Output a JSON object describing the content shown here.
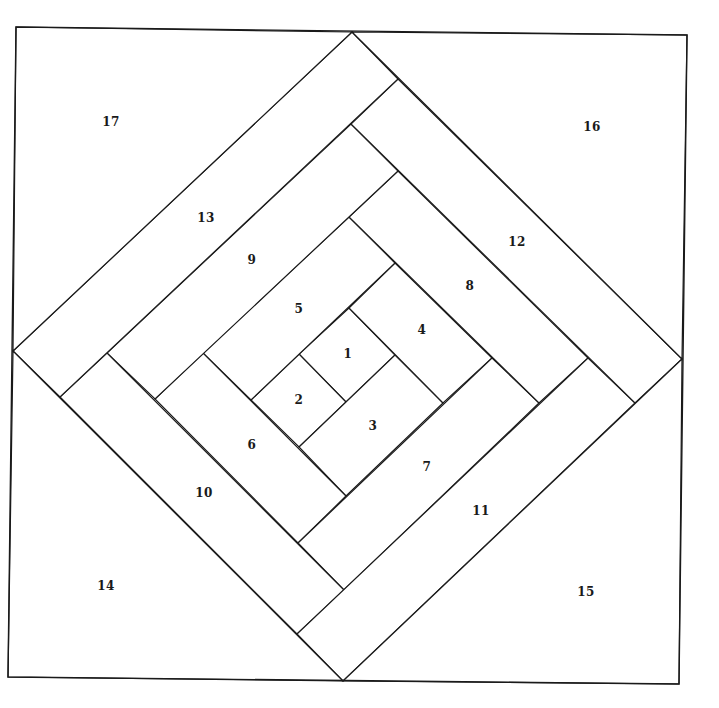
{
  "diagram": {
    "outer_square": [
      [
        16,
        27
      ],
      [
        687,
        35
      ],
      [
        679,
        684
      ],
      [
        8,
        677
      ]
    ],
    "stroke_color": "#1a1a1a",
    "background": "#ffffff",
    "pieces": [
      {
        "id": "1",
        "label": "1",
        "label_pos": [
          348,
          354
        ],
        "points": [
          [
            299,
            354
          ],
          [
            349,
            308
          ],
          [
            395,
            355
          ],
          [
            346,
            402
          ]
        ]
      },
      {
        "id": "2",
        "label": "2",
        "label_pos": [
          299,
          400
        ],
        "points": [
          [
            251,
            400
          ],
          [
            299,
            354
          ],
          [
            346,
            402
          ],
          [
            299,
            447
          ]
        ]
      },
      {
        "id": "3",
        "label": "3",
        "label_pos": [
          373,
          426
        ],
        "points": [
          [
            395,
            355
          ],
          [
            443,
            403
          ],
          [
            346,
            496
          ],
          [
            299,
            447
          ]
        ]
      },
      {
        "id": "4",
        "label": "4",
        "label_pos": [
          422,
          330
        ],
        "points": [
          [
            349,
            308
          ],
          [
            395,
            263
          ],
          [
            492,
            358
          ],
          [
            443,
            403
          ]
        ]
      },
      {
        "id": "5",
        "label": "5",
        "label_pos": [
          299,
          309
        ],
        "points": [
          [
            203,
            353
          ],
          [
            349,
            217
          ],
          [
            395,
            263
          ],
          [
            251,
            400
          ]
        ]
      },
      {
        "id": "6",
        "label": "6",
        "label_pos": [
          252,
          445
        ],
        "points": [
          [
            155,
            399
          ],
          [
            203,
            353
          ],
          [
            346,
            496
          ],
          [
            298,
            543
          ]
        ]
      },
      {
        "id": "7",
        "label": "7",
        "label_pos": [
          427,
          467
        ],
        "points": [
          [
            492,
            358
          ],
          [
            539,
            403
          ],
          [
            344,
            590
          ],
          [
            298,
            543
          ]
        ]
      },
      {
        "id": "8",
        "label": "8",
        "label_pos": [
          470,
          286
        ],
        "points": [
          [
            349,
            217
          ],
          [
            398,
            171
          ],
          [
            588,
            358
          ],
          [
            539,
            403
          ]
        ]
      },
      {
        "id": "9",
        "label": "9",
        "label_pos": [
          252,
          260
        ],
        "points": [
          [
            107,
            353
          ],
          [
            351,
            124
          ],
          [
            398,
            171
          ],
          [
            155,
            399
          ]
        ]
      },
      {
        "id": "10",
        "label": "10",
        "label_pos": [
          204,
          493
        ],
        "points": [
          [
            60,
            397
          ],
          [
            107,
            353
          ],
          [
            344,
            590
          ],
          [
            297,
            634
          ]
        ]
      },
      {
        "id": "11",
        "label": "11",
        "label_pos": [
          481,
          511
        ],
        "points": [
          [
            588,
            358
          ],
          [
            635,
            403
          ],
          [
            343,
            681
          ],
          [
            297,
            634
          ]
        ]
      },
      {
        "id": "12",
        "label": "12",
        "label_pos": [
          517,
          242
        ],
        "points": [
          [
            351,
            124
          ],
          [
            398,
            79
          ],
          [
            682,
            359
          ],
          [
            635,
            403
          ]
        ]
      },
      {
        "id": "13",
        "label": "13",
        "label_pos": [
          206,
          218
        ],
        "points": [
          [
            13,
            351
          ],
          [
            352,
            32
          ],
          [
            398,
            79
          ],
          [
            60,
            397
          ]
        ]
      },
      {
        "id": "14",
        "label": "14",
        "label_pos": [
          106,
          586
        ],
        "points": [
          [
            8,
            677
          ],
          [
            13,
            351
          ],
          [
            343,
            681
          ]
        ]
      },
      {
        "id": "15",
        "label": "15",
        "label_pos": [
          586,
          592
        ],
        "points": [
          [
            343,
            681
          ],
          [
            682,
            359
          ],
          [
            679,
            684
          ]
        ]
      },
      {
        "id": "16",
        "label": "16",
        "label_pos": [
          592,
          127
        ],
        "points": [
          [
            352,
            32
          ],
          [
            687,
            35
          ],
          [
            682,
            359
          ]
        ]
      },
      {
        "id": "17",
        "label": "17",
        "label_pos": [
          111,
          122
        ],
        "points": [
          [
            16,
            27
          ],
          [
            352,
            32
          ],
          [
            13,
            351
          ]
        ]
      }
    ]
  }
}
